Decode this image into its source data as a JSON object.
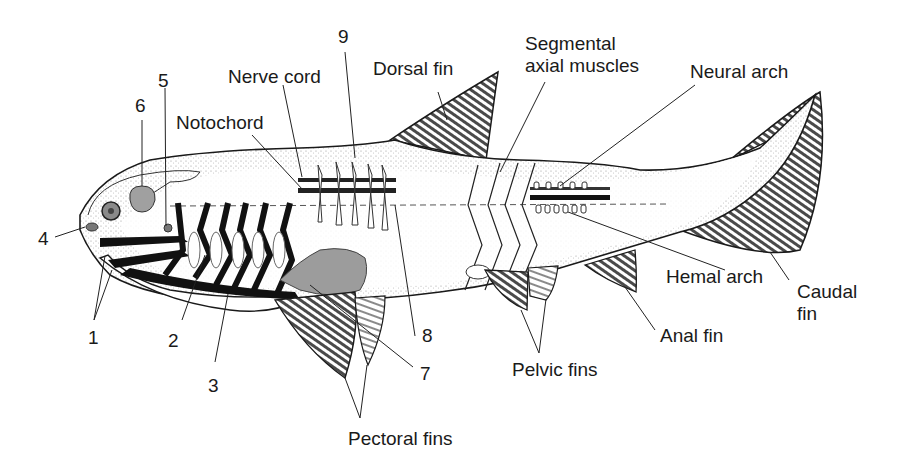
{
  "diagram": {
    "colors": {
      "outline": "#1a1a1a",
      "body_fill": "#ffffff",
      "stipple": "#9a9a9a",
      "fin_stripe": "#3a3a3a",
      "gray_organ": "#9c9c9c",
      "gill_bar": "#111111"
    },
    "labels": {
      "n1": "1",
      "n2": "2",
      "n3": "3",
      "n4": "4",
      "n5": "5",
      "n6": "6",
      "n7": "7",
      "n8": "8",
      "n9": "9",
      "notochord": "Notochord",
      "nerve_cord": "Nerve cord",
      "dorsal_fin": "Dorsal fin",
      "segmental_line1": "Segmental",
      "segmental_line2": "axial muscles",
      "neural_arch": "Neural arch",
      "hemal_arch": "Hemal arch",
      "caudal_line1": "Caudal",
      "caudal_line2": "fin",
      "anal_fin": "Anal fin",
      "pelvic_fins": "Pelvic fins",
      "pectoral_fins": "Pectoral fins"
    }
  }
}
